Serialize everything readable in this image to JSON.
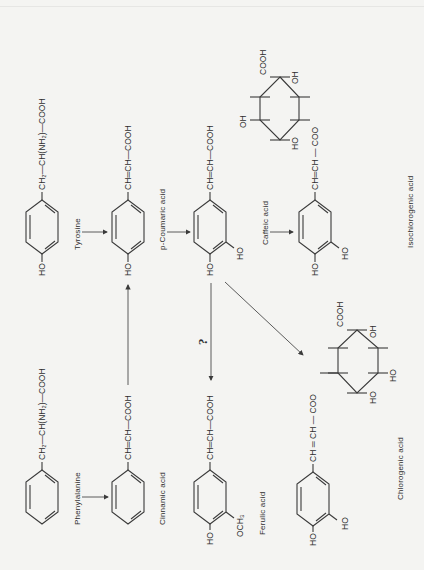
{
  "figure": {
    "orientation": "rotated-90-ccw",
    "compounds": [
      {
        "id": "tyrosine",
        "para": "HO",
        "chain": [
          "CH₂",
          "CH(NH₂)",
          "COOH"
        ],
        "name": "Tyrosine"
      },
      {
        "id": "p-coumaric",
        "para": "HO",
        "chain": [
          "CH",
          "CH",
          "COOH"
        ],
        "name": "p-Coumaric acid"
      },
      {
        "id": "caffeic",
        "para": "HO",
        "meta": "HO",
        "chain": [
          "CH",
          "CH",
          "COOH"
        ],
        "name": "Caffeic acid"
      },
      {
        "id": "isochlorogenic",
        "para": "HO",
        "meta": "HO",
        "chain": [
          "CH",
          "CH",
          "COO"
        ],
        "quinic": {
          "top_left": "COOH",
          "top_right": "OH",
          "left": "OH",
          "bottom": "HO"
        },
        "name": "Isochlorogenic acid"
      },
      {
        "id": "phenylalanine",
        "chain": [
          "CH₂",
          "CH(NH₂)",
          "COOH"
        ],
        "name": "Phenylalanine"
      },
      {
        "id": "cinnamic",
        "chain": [
          "CH",
          "CH",
          "COOH"
        ],
        "name": "Cinnamic acid"
      },
      {
        "id": "ferulic",
        "para": "HO",
        "meta": "OCH₃",
        "chain": [
          "CH",
          "CH",
          "COOH"
        ],
        "name": "Ferulic acid"
      },
      {
        "id": "chlorogenic",
        "para": "HO",
        "meta": "HO",
        "chain": [
          "CH",
          "CH",
          "COO"
        ],
        "quinic": {
          "top_left": "COOH",
          "top_right": "OH",
          "right": "HO",
          "bottom": "HO"
        },
        "name": "Chlorogenic acid"
      }
    ],
    "labels": {
      "tyrosine_chain": "CH₂—CH(NH₂)—COOH",
      "phenylalanine_chain": "CH₂—CH(NH₂)—COOH",
      "coumaric_chain": "CH═CH—COOH",
      "caffeic_chain": "CH═CH—COOH",
      "cinnamic_chain": "CH═CH—COOH",
      "ferulic_chain": "CH═CH—COOH",
      "iso_chain": "CH═CH — COO",
      "chloro_chain": "CH ═ CH — COO",
      "ho": "HO",
      "oh": "OH",
      "och3": "OCH₃",
      "cooh": "COOH",
      "question": "?"
    }
  }
}
